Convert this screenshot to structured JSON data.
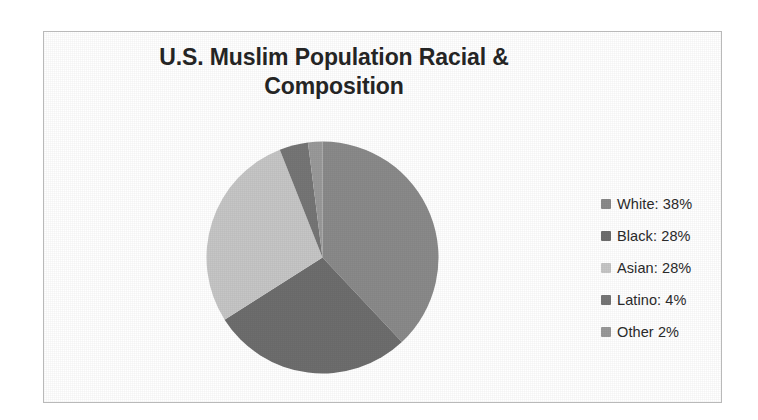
{
  "chart_data": {
    "type": "pie",
    "title_lines": [
      "U.S. Muslim Population Racial &",
      "Composition"
    ],
    "categories": [
      "White",
      "Black",
      "Asian",
      "Latino",
      "Other"
    ],
    "values": [
      38,
      28,
      28,
      4,
      2
    ],
    "unit": "%",
    "legend_labels": [
      "White: 38%",
      "Black: 28%",
      "Asian: 28%",
      "Latino: 4%",
      "Other 2%"
    ],
    "colors": [
      "#8a8a8a",
      "#6e6e6e",
      "#c6c6c6",
      "#767676",
      "#9a9a9a"
    ],
    "legend_position": "right",
    "start_angle": 0,
    "direction": "clockwise",
    "grid": false,
    "data_labels": false,
    "xlabel": "",
    "ylabel": ""
  },
  "frame": {
    "border_color": "#b9b9b9",
    "background": "#ffffff"
  }
}
